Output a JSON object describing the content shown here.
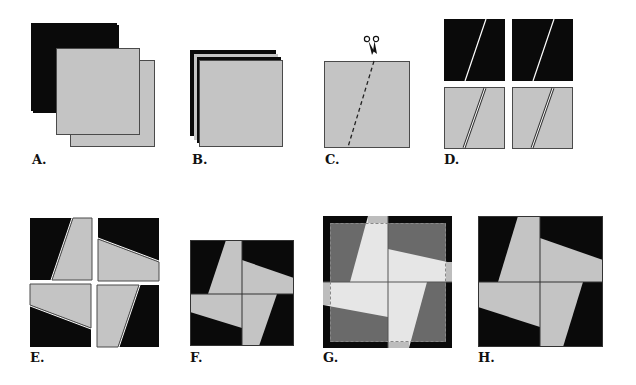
{
  "figure": {
    "panels": [
      {
        "id": "A",
        "label": "A.",
        "caption": "Two black squares and two gray squares"
      },
      {
        "id": "B",
        "label": "B.",
        "caption": "Squares stacked alternating black and gray"
      },
      {
        "id": "C",
        "label": "C.",
        "caption": "Cut the stack along a slanted dashed line with scissors"
      },
      {
        "id": "D",
        "label": "D.",
        "caption": "Cut pieces: two black squares and two gray squares with slanted cuts"
      },
      {
        "id": "E",
        "label": "E.",
        "caption": "Pieces swapped and rotated into four quadrants"
      },
      {
        "id": "F",
        "label": "F.",
        "caption": "Quadrants sewn together forming a pinwheel"
      },
      {
        "id": "G",
        "label": "G.",
        "caption": "Trim to size along dashed border"
      },
      {
        "id": "H",
        "label": "H.",
        "caption": "Finished pinwheel block"
      }
    ],
    "colors": {
      "black": "#0a0a0a",
      "gray": "#c4c4c4",
      "light": "#e6e6e6",
      "dark_gray": "#6a6a6a",
      "outline": "#4a4a4a"
    },
    "icons": {
      "scissors": "scissors-icon"
    }
  }
}
